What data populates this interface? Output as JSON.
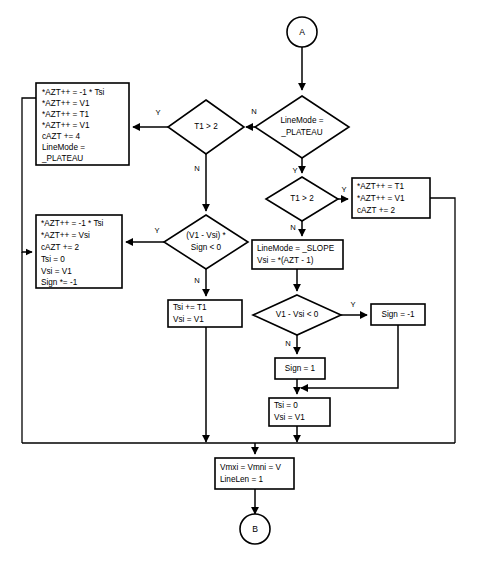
{
  "diagram": {
    "colors": {
      "stroke": "#000000",
      "fill": "#ffffff",
      "background": "#ffffff"
    },
    "terminals": [
      {
        "id": "A",
        "label": "A",
        "cx": 302,
        "cy": 32,
        "r": 15
      },
      {
        "id": "B",
        "label": "B",
        "cx": 265,
        "cy": 533,
        "r": 15
      }
    ],
    "decisions": [
      {
        "id": "d_linemode_plateau",
        "lines": [
          "LineMode =",
          "_PLATEAU"
        ],
        "cx": 302,
        "cy": 127,
        "rx": 47,
        "ry": 31
      },
      {
        "id": "d_t1_gt2_left",
        "lines": [
          "T1 > 2"
        ],
        "cx": 206,
        "cy": 127,
        "rx": 38,
        "ry": 27
      },
      {
        "id": "d_t1_gt2_inner",
        "lines": [
          "T1 > 2"
        ],
        "cx": 302,
        "cy": 199,
        "rx": 36,
        "ry": 22
      },
      {
        "id": "d_v1_vsi_sign",
        "lines": [
          "(V1 - Vsi) *",
          "Sign < 0"
        ],
        "cx": 206,
        "cy": 242,
        "rx": 42,
        "ry": 27
      },
      {
        "id": "d_v1_minus_vsi",
        "lines": [
          "V1 - Vsi < 0"
        ],
        "cx": 297,
        "cy": 315,
        "rx": 44,
        "ry": 20
      }
    ],
    "processes": [
      {
        "id": "p_plateau_block",
        "lines": [
          "*AZT++ = -1 * Tsi",
          "*AZT++ = V1",
          "*AZT++ = T1",
          "*AZT++ = V1",
          "cAZT += 4",
          "LineMode =",
          "      _PLATEAU"
        ],
        "x": 36,
        "y": 83,
        "w": 93,
        "h": 82
      },
      {
        "id": "p_slope_block",
        "lines": [
          "*AZT++ = -1 * Tsi",
          "*AZT++ = Vsi",
          "cAZT += 2",
          "Tsi = 0",
          "Vsi = V1",
          "Sign *= -1"
        ],
        "x": 36,
        "y": 215,
        "w": 86,
        "h": 73
      },
      {
        "id": "p_azt_t1_v1",
        "lines": [
          "*AZT++ = T1",
          "*AZT++ = V1",
          "cAZT += 2"
        ],
        "x": 352,
        "y": 178,
        "w": 78,
        "h": 40
      },
      {
        "id": "p_set_slope",
        "lines": [
          "LineMode = _SLOPE",
          "Vsi = *(AZT - 1)"
        ],
        "x": 252,
        "y": 240,
        "w": 91,
        "h": 29
      },
      {
        "id": "p_tsi_plus_t1",
        "lines": [
          "Tsi += T1",
          "Vsi = V1"
        ],
        "x": 168,
        "y": 300,
        "w": 74,
        "h": 27
      },
      {
        "id": "p_sign_neg1",
        "lines": [
          "Sign = -1"
        ],
        "x": 371,
        "y": 304,
        "w": 54,
        "h": 21
      },
      {
        "id": "p_sign_1",
        "lines": [
          "Sign = 1"
        ],
        "x": 275,
        "y": 358,
        "w": 50,
        "h": 21
      },
      {
        "id": "p_tsi0_vsi_v1",
        "lines": [
          "Tsi = 0",
          "Vsi = V1"
        ],
        "x": 269,
        "y": 398,
        "w": 61,
        "h": 28
      },
      {
        "id": "p_vmxi_linelen",
        "lines": [
          "Vmxi = Vmni = V",
          "LineLen = 1"
        ],
        "x": 215,
        "y": 458,
        "w": 79,
        "h": 31
      }
    ],
    "edge_labels": [
      {
        "id": "lbl_n_linemode",
        "text": "N",
        "x": 254,
        "y": 112
      },
      {
        "id": "lbl_y_linemode",
        "text": "Y",
        "x": 295,
        "y": 171
      },
      {
        "id": "lbl_y_t1left",
        "text": "Y",
        "x": 158,
        "y": 113
      },
      {
        "id": "lbl_n_t1left",
        "text": "N",
        "x": 197,
        "y": 169
      },
      {
        "id": "lbl_y_t1inner",
        "text": "Y",
        "x": 344,
        "y": 190
      },
      {
        "id": "lbl_n_t1inner",
        "text": "N",
        "x": 293,
        "y": 228
      },
      {
        "id": "lbl_y_sign",
        "text": "Y",
        "x": 157,
        "y": 231
      },
      {
        "id": "lbl_n_sign",
        "text": "N",
        "x": 197,
        "y": 281
      },
      {
        "id": "lbl_y_v1vsi",
        "text": "Y",
        "x": 353,
        "y": 305
      },
      {
        "id": "lbl_n_v1vsi",
        "text": "N",
        "x": 288,
        "y": 344
      }
    ]
  }
}
